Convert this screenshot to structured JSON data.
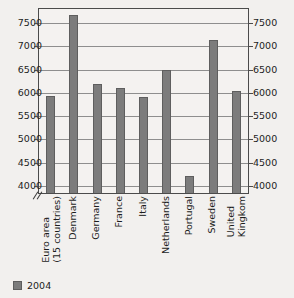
{
  "chart_data": {
    "type": "bar",
    "title": "",
    "xlabel": "",
    "ylabel": "",
    "categories": [
      "Euro area\n(15 countries)",
      "Denmark",
      "Germany",
      "France",
      "Italy",
      "Netherlands",
      "Portugal",
      "Sweden",
      "United\nKingkom"
    ],
    "series": [
      {
        "name": "2004",
        "values": [
          5930,
          7670,
          6180,
          6110,
          5910,
          6490,
          4210,
          7130,
          6050
        ]
      }
    ],
    "values": [
      5930,
      7670,
      6180,
      6110,
      5910,
      6490,
      4210,
      7130,
      6050
    ],
    "ylim": [
      3850,
      7800
    ],
    "yticks": [
      4000,
      4500,
      5000,
      5500,
      6000,
      6500,
      7000,
      7500
    ],
    "ytick_labels": [
      "4000",
      "4500",
      "5000",
      "5500",
      "6000",
      "6500",
      "7000",
      "7500"
    ],
    "grid": true,
    "axis_break": true,
    "axis_break_symbol": "//",
    "dual_y_axis": true,
    "legend_position": "bottom-left",
    "bar_color": "#7c7c7c",
    "plot_background": "#f4f2f0",
    "page_background": "#f2f0ee",
    "axis_color": "#4b4b4b",
    "grid_color": "#8e8e8e"
  },
  "legend": {
    "entries": [
      {
        "label": "2004",
        "color": "#7c7c7c"
      }
    ]
  },
  "axis": {
    "left_labels": [
      "7500",
      "7000",
      "6500",
      "6000",
      "5500",
      "5000",
      "4500",
      "4000"
    ],
    "right_labels": [
      "7500",
      "7000",
      "6500",
      "6000",
      "5500",
      "5000",
      "4500",
      "4000"
    ]
  }
}
